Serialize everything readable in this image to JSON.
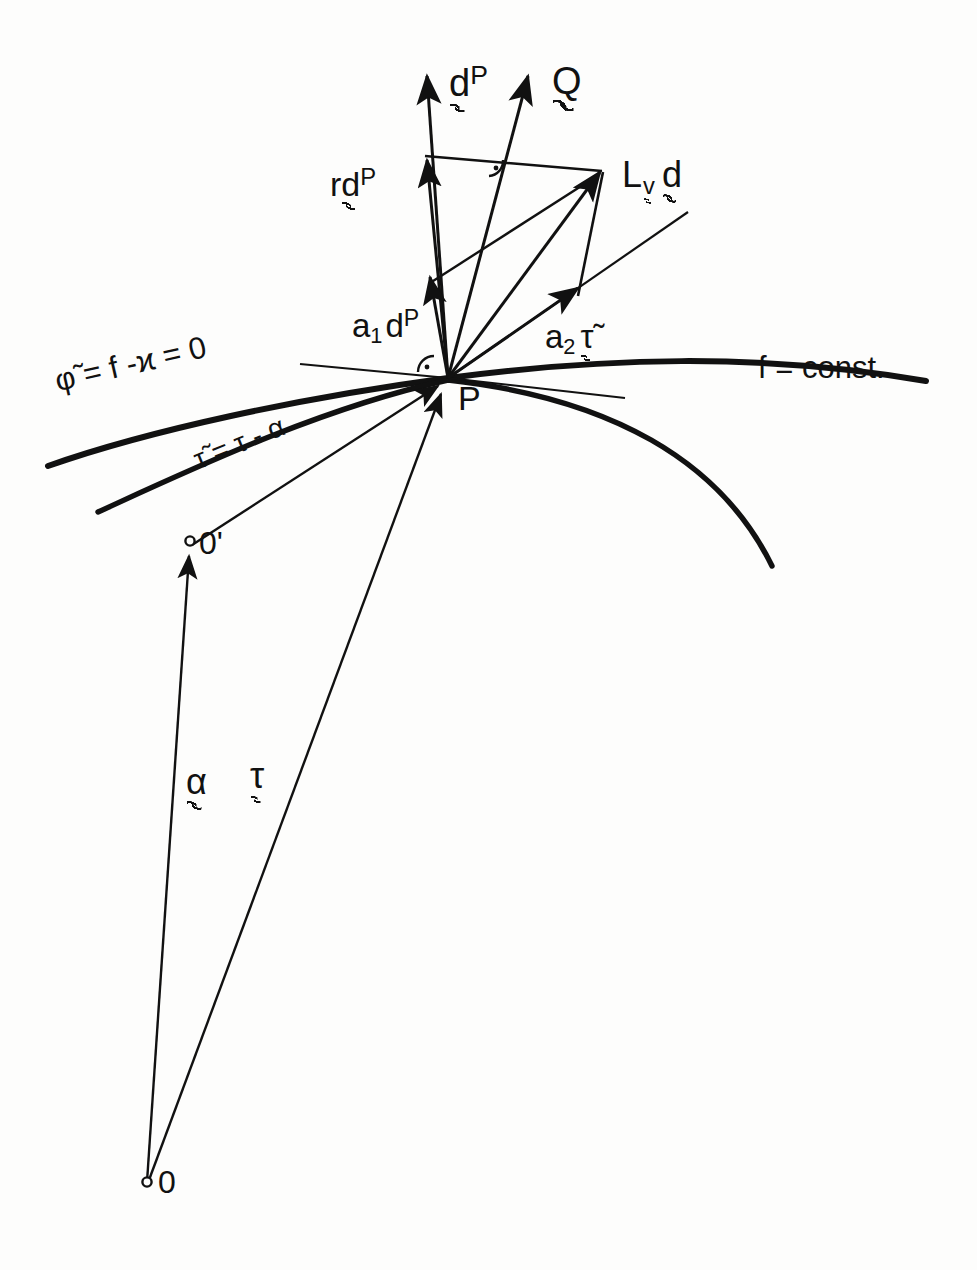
{
  "figure": {
    "kind": "geometric-vector-diagram",
    "background_color": "#fdfdfc",
    "ink_color": "#111111",
    "points": [
      {
        "id": "P",
        "label": "P",
        "x": 448,
        "y": 378,
        "marker": "none"
      },
      {
        "id": "Oq",
        "label": "0'",
        "x": 190,
        "y": 541,
        "marker": "open-circle"
      },
      {
        "id": "O",
        "label": "0",
        "x": 147,
        "y": 1182,
        "marker": "open-circle"
      }
    ],
    "labels": {
      "d_P_tip": {
        "text": "d",
        "sup": "P",
        "x": 449,
        "y": 74
      },
      "Q_tip": {
        "text": "Q",
        "sup": "",
        "x": 552,
        "y": 74
      },
      "r_d_P": {
        "prefix": "r",
        "text": "d",
        "sup": "P",
        "x": 347,
        "y": 176
      },
      "Lie_d": {
        "text": "L",
        "sub": "v",
        "tail": "d",
        "x": 592,
        "y": 170
      },
      "a1_d_P": {
        "coef": "a",
        "coef_sub": "1",
        "text": "d",
        "sup": "P",
        "x": 367,
        "y": 320
      },
      "a2_tau": {
        "coef": "a",
        "coef_sub": "2",
        "text": "τ̃",
        "x": 559,
        "y": 333
      },
      "phi_curve": {
        "text": "φ̃ = f -ϰ = 0",
        "x": 62,
        "y": 380
      },
      "tau_tilde": {
        "text": "τ̃ = τ - α",
        "x": 196,
        "y": 455
      },
      "f_const": {
        "text": "f = const.",
        "x": 758,
        "y": 368
      },
      "alpha_vec": {
        "text": "α",
        "x": 194,
        "y": 782
      },
      "tau_vec": {
        "text": "τ",
        "x": 258,
        "y": 776
      }
    },
    "curves": [
      {
        "name": "phi-tilde-curve",
        "desc": "upper thick curve through P labelled phi-tilde = f - kappa = 0"
      },
      {
        "name": "f-const-curve",
        "desc": "lower thick curve labelled f = const."
      }
    ],
    "vectors": [
      {
        "name": "d-P",
        "from": "P",
        "to": "tip-d-P"
      },
      {
        "name": "Q",
        "from": "P",
        "to": "tip-Q"
      },
      {
        "name": "r-d-P",
        "from": "P",
        "to": "mid-d-P"
      },
      {
        "name": "a1-d-P",
        "from": "P",
        "to": "low-d-P"
      },
      {
        "name": "a2-tau",
        "from": "P",
        "to": "tau-corner"
      },
      {
        "name": "Lie-v-d",
        "from": "P",
        "to": "Lie-corner"
      },
      {
        "name": "alpha",
        "from": "O",
        "to": "Oq"
      },
      {
        "name": "tau",
        "from": "O",
        "to": "P"
      },
      {
        "name": "tau-tilde",
        "from": "Oq",
        "to": "P"
      }
    ],
    "right_angle_markers": [
      {
        "at": "P",
        "x": 430,
        "y": 362
      },
      {
        "at": "Lie-corner",
        "x": 497,
        "y": 163
      }
    ]
  }
}
